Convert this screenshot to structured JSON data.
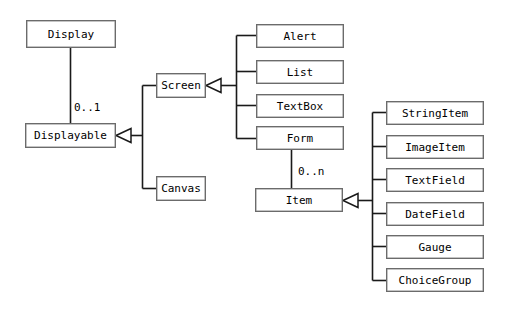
{
  "diagram": {
    "type": "uml-class-diagram",
    "width": 508,
    "height": 315,
    "background_color": "#ffffff",
    "box_fill_color": "#ffffff",
    "box_border_color": "#6b6b6b",
    "line_color": "#1a1a1a",
    "text_color": "#000000",
    "classes": [
      {
        "id": "display",
        "label": "Display",
        "x": 26,
        "y": 20,
        "w": 90,
        "h": 28
      },
      {
        "id": "displayable",
        "label": "Displayable",
        "x": 25,
        "y": 123,
        "w": 91,
        "h": 25
      },
      {
        "id": "screen",
        "label": "Screen",
        "x": 156,
        "y": 73,
        "w": 50,
        "h": 25
      },
      {
        "id": "canvas",
        "label": "Canvas",
        "x": 156,
        "y": 176,
        "w": 50,
        "h": 25
      },
      {
        "id": "alert",
        "label": "Alert",
        "x": 256,
        "y": 24,
        "w": 88,
        "h": 24
      },
      {
        "id": "list",
        "label": "List",
        "x": 256,
        "y": 60,
        "w": 88,
        "h": 24
      },
      {
        "id": "textbox",
        "label": "TextBox",
        "x": 256,
        "y": 94,
        "w": 88,
        "h": 24
      },
      {
        "id": "form",
        "label": "Form",
        "x": 256,
        "y": 126,
        "w": 88,
        "h": 24
      },
      {
        "id": "item",
        "label": "Item",
        "x": 255,
        "y": 188,
        "w": 88,
        "h": 24
      },
      {
        "id": "stringitem",
        "label": "StringItem",
        "x": 386,
        "y": 101,
        "w": 98,
        "h": 24
      },
      {
        "id": "imageitem",
        "label": "ImageItem",
        "x": 386,
        "y": 135,
        "w": 98,
        "h": 24
      },
      {
        "id": "textfield",
        "label": "TextField",
        "x": 386,
        "y": 168,
        "w": 98,
        "h": 24
      },
      {
        "id": "datefield",
        "label": "DateField",
        "x": 386,
        "y": 202,
        "w": 98,
        "h": 24
      },
      {
        "id": "gauge",
        "label": "Gauge",
        "x": 386,
        "y": 235,
        "w": 98,
        "h": 24
      },
      {
        "id": "choicegroup",
        "label": "ChoiceGroup",
        "x": 386,
        "y": 268,
        "w": 98,
        "h": 24
      }
    ],
    "multiplicity_labels": [
      {
        "id": "display-displayable-mult",
        "label": "0..1",
        "x": 74,
        "y": 102
      },
      {
        "id": "form-item-mult",
        "label": "0..n",
        "x": 298,
        "y": 166
      }
    ],
    "associations": [
      {
        "id": "display-to-displayable",
        "from": "display",
        "to": "displayable",
        "multiplicity": "0..1"
      },
      {
        "id": "form-to-item",
        "from": "form",
        "to": "item",
        "multiplicity": "0..n"
      }
    ],
    "generalizations": [
      {
        "id": "gen-to-displayable",
        "parent": "Displayable",
        "children": [
          "Screen",
          "Canvas"
        ]
      },
      {
        "id": "gen-to-screen",
        "parent": "Screen",
        "children": [
          "Alert",
          "List",
          "TextBox",
          "Form"
        ]
      },
      {
        "id": "gen-to-item",
        "parent": "Item",
        "children": [
          "StringItem",
          "ImageItem",
          "TextField",
          "DateField",
          "Gauge",
          "ChoiceGroup"
        ]
      }
    ]
  }
}
